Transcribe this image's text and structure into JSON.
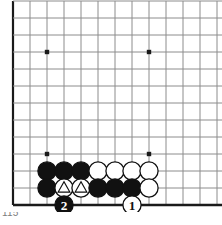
{
  "figure": {
    "kind": "go-board-diagram",
    "caption": "115",
    "board": {
      "columns": 13,
      "rows": 12,
      "cell": 17,
      "origin_x": 13,
      "origin_y": 18,
      "line_color": "#8c8c8c",
      "edge_color": "#1a1a1a",
      "background": "#ffffff",
      "star_point_color": "#1a1a1a",
      "star_points": [
        {
          "col": 2,
          "row": 2
        },
        {
          "col": 8,
          "row": 2
        },
        {
          "col": 2,
          "row": 8
        },
        {
          "col": 8,
          "row": 8
        }
      ]
    },
    "colors": {
      "black_stone": "#111111",
      "white_stone": "#ffffff",
      "stone_outline": "#111111",
      "mark": "#111111",
      "label_on_black": "#ffffff",
      "label_on_white": "#111111"
    },
    "stones": [
      {
        "col": 2,
        "row": 9,
        "color": "black",
        "mark": "none",
        "label": ""
      },
      {
        "col": 3,
        "row": 9,
        "color": "black",
        "mark": "none",
        "label": ""
      },
      {
        "col": 4,
        "row": 9,
        "color": "black",
        "mark": "none",
        "label": ""
      },
      {
        "col": 5,
        "row": 9,
        "color": "white",
        "mark": "none",
        "label": ""
      },
      {
        "col": 6,
        "row": 9,
        "color": "white",
        "mark": "none",
        "label": ""
      },
      {
        "col": 7,
        "row": 9,
        "color": "white",
        "mark": "none",
        "label": ""
      },
      {
        "col": 8,
        "row": 9,
        "color": "white",
        "mark": "none",
        "label": ""
      },
      {
        "col": 2,
        "row": 10,
        "color": "black",
        "mark": "none",
        "label": ""
      },
      {
        "col": 3,
        "row": 10,
        "color": "white",
        "mark": "triangle",
        "label": ""
      },
      {
        "col": 4,
        "row": 10,
        "color": "white",
        "mark": "triangle",
        "label": ""
      },
      {
        "col": 5,
        "row": 10,
        "color": "black",
        "mark": "none",
        "label": ""
      },
      {
        "col": 6,
        "row": 10,
        "color": "black",
        "mark": "none",
        "label": ""
      },
      {
        "col": 7,
        "row": 10,
        "color": "black",
        "mark": "none",
        "label": ""
      },
      {
        "col": 8,
        "row": 10,
        "color": "white",
        "mark": "none",
        "label": ""
      },
      {
        "col": 3,
        "row": 11,
        "color": "black",
        "mark": "none",
        "label": "2"
      },
      {
        "col": 7,
        "row": 11,
        "color": "white",
        "mark": "none",
        "label": "1"
      }
    ],
    "moves": [
      {
        "number": "1",
        "color": "white",
        "col": 7,
        "row": 11
      },
      {
        "number": "2",
        "color": "black",
        "col": 3,
        "row": 11
      }
    ]
  }
}
